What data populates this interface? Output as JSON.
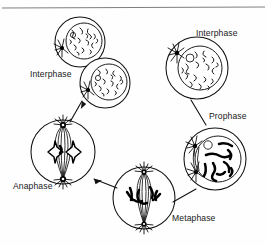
{
  "figure": {
    "background_color": "#fefefe",
    "ink_color": "#111111",
    "rule_color": "#6f6f6f",
    "width": 267,
    "height": 246
  },
  "labels": {
    "interphase_left": "Interphase",
    "interphase_right": "Interphase",
    "prophase": "Prophase",
    "metaphase": "Metaphase",
    "anaphase": "Anaphase"
  },
  "stages": [
    {
      "id": "interphase-right",
      "label": "Interphase",
      "label_x": 196,
      "label_y": 36,
      "cell_cx": 197,
      "cell_cy": 68,
      "cell_r": 31,
      "nucleus_r": 22,
      "has_nucleolus": true,
      "has_aster": true,
      "aster_count": 1,
      "chromatin": "diffuse-threads"
    },
    {
      "id": "prophase",
      "label": "Prophase",
      "label_x": 209,
      "label_y": 119,
      "cell_cx": 215,
      "cell_cy": 159,
      "cell_r": 31,
      "nucleus_r": 23,
      "has_nucleolus": true,
      "has_aster": true,
      "aster_count": 2,
      "chromatin": "condensed-chromosomes"
    },
    {
      "id": "metaphase",
      "label": "Metaphase",
      "label_x": 172,
      "label_y": 221,
      "cell_cx": 144,
      "cell_cy": 198,
      "cell_r": 31,
      "spindle": "equatorial-plate",
      "has_aster": true,
      "aster_count": 2
    },
    {
      "id": "anaphase",
      "label": "Anaphase",
      "label_x": 13,
      "label_y": 189,
      "cell_cx": 63,
      "cell_cy": 152,
      "cell_r": 32,
      "spindle": "separating-chromatids",
      "has_aster": true,
      "aster_count": 2
    },
    {
      "id": "interphase-left-upper",
      "label": "Interphase",
      "cell_cx": 80,
      "cell_cy": 42,
      "cell_r": 25,
      "nucleus_r": 18,
      "has_nucleolus": true,
      "has_aster": true,
      "aster_count": 1,
      "chromatin": "diffuse-threads"
    },
    {
      "id": "interphase-left-lower",
      "label": "Interphase",
      "label_x": 30,
      "label_y": 77,
      "cell_cx": 105,
      "cell_cy": 83,
      "cell_r": 25,
      "nucleus_r": 18,
      "has_nucleolus": true,
      "has_aster": true,
      "aster_count": 1,
      "chromatin": "diffuse-threads"
    }
  ],
  "connectors": [
    {
      "id": "interphase-to-prophase",
      "from": "interphase-right",
      "to": "prophase",
      "x1": 191,
      "y1": 100,
      "x2": 206,
      "y2": 125,
      "arrow": false
    },
    {
      "id": "prophase-to-metaphase",
      "from": "prophase",
      "to": "metaphase",
      "x1": 196,
      "y1": 188,
      "x2": 172,
      "y2": 202,
      "arrow": false
    },
    {
      "id": "metaphase-to-anaphase",
      "from": "metaphase",
      "to": "anaphase",
      "x1": 117,
      "y1": 188,
      "x2": 92,
      "y2": 179,
      "arrow": true
    },
    {
      "id": "anaphase-to-interphase",
      "from": "anaphase",
      "to": "interphase-left-lower",
      "x1": 70,
      "y1": 122,
      "x2": 82,
      "y2": 101,
      "arrow": true
    }
  ],
  "top_rule": {
    "x1": 2,
    "y1": 8,
    "x2": 265,
    "y2": 7
  }
}
